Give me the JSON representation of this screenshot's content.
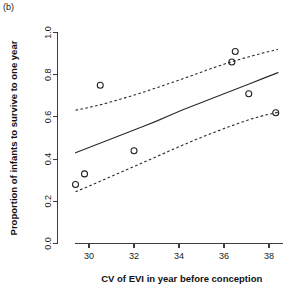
{
  "panel": {
    "label": "(b)"
  },
  "chart_data": {
    "type": "scatter",
    "title": "",
    "xlabel": "CV of EVI in year before conception",
    "ylabel": "Proportion of infants to survive to one year",
    "xlim": [
      28.6,
      39.2
    ],
    "ylim": [
      0.0,
      1.05
    ],
    "xticks": [
      30,
      32,
      34,
      36,
      38
    ],
    "xticklabels": [
      "30",
      "32",
      "34",
      "36",
      "38"
    ],
    "yticks": [
      0.0,
      0.2,
      0.4,
      0.6,
      0.8,
      1.0
    ],
    "yticklabels": [
      "0.0",
      "0.2",
      "0.4",
      "0.6",
      "0.8",
      "1.0"
    ],
    "grid": false,
    "legend": null,
    "points": {
      "name": "Observed proportions",
      "marker": "open-circle",
      "x": [
        29.4,
        29.8,
        30.5,
        32.0,
        36.35,
        36.5,
        37.1,
        38.3
      ],
      "y": [
        0.28,
        0.33,
        0.75,
        0.44,
        0.86,
        0.91,
        0.71,
        0.62
      ]
    },
    "series": [
      {
        "name": "Fitted model",
        "style": "solid",
        "x": [
          29.4,
          30.0,
          30.6,
          31.2,
          31.8,
          32.4,
          33.0,
          33.6,
          34.2,
          34.8,
          35.4,
          36.0,
          36.6,
          37.2,
          37.8,
          38.4
        ],
        "y": [
          0.43,
          0.455,
          0.48,
          0.505,
          0.53,
          0.555,
          0.58,
          0.608,
          0.635,
          0.66,
          0.685,
          0.71,
          0.735,
          0.76,
          0.785,
          0.81
        ]
      },
      {
        "name": "Upper 95% confidence band",
        "style": "dashed",
        "x": [
          29.4,
          30.0,
          30.6,
          31.2,
          31.8,
          32.4,
          33.0,
          33.6,
          34.2,
          34.8,
          35.4,
          36.0,
          36.6,
          37.2,
          37.8,
          38.4
        ],
        "y": [
          0.632,
          0.645,
          0.66,
          0.678,
          0.697,
          0.717,
          0.738,
          0.76,
          0.782,
          0.805,
          0.828,
          0.85,
          0.87,
          0.888,
          0.905,
          0.92
        ]
      },
      {
        "name": "Lower 95% confidence band",
        "style": "dashed",
        "x": [
          29.4,
          30.0,
          30.6,
          31.2,
          31.8,
          32.4,
          33.0,
          33.6,
          34.2,
          34.8,
          35.4,
          36.0,
          36.6,
          37.2,
          37.8,
          38.4
        ],
        "y": [
          0.245,
          0.272,
          0.3,
          0.328,
          0.356,
          0.384,
          0.412,
          0.44,
          0.468,
          0.495,
          0.52,
          0.545,
          0.568,
          0.59,
          0.608,
          0.622
        ]
      }
    ]
  }
}
